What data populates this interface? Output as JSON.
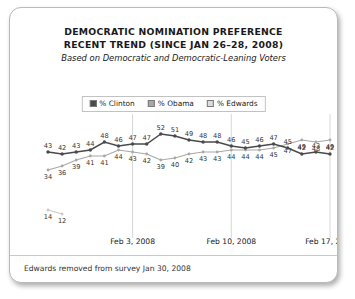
{
  "card": {
    "title_line1": "DEMOCRATIC NOMINATION PREFERENCE",
    "title_line2": "RECENT TREND (SINCE JAN 26–28, 2008)",
    "subtitle": "Based on Democratic and Democratic-Leaning Voters",
    "footnote": "Edwards removed from survey Jan 30, 2008"
  },
  "legend": {
    "items": [
      {
        "label": "% Clinton",
        "color": "#4a4a4a"
      },
      {
        "label": "% Obama",
        "color": "#a8a8a8"
      },
      {
        "label": "% Edwards",
        "color": "#dcdcdc"
      }
    ]
  },
  "chart_data": {
    "type": "line",
    "title": "DEMOCRATIC NOMINATION PREFERENCE RECENT TREND (SINCE JAN 26–28, 2008)",
    "subtitle": "Based on Democratic and Democratic-Leaning Voters",
    "xlabel": "",
    "ylabel": "",
    "ylim": [
      10,
      55
    ],
    "grid": "vertical-only",
    "legend_position": "top-center",
    "annotation": "Edwards removed from survey Jan 30, 2008",
    "n_points": 21,
    "tick_labels": [
      "Feb 3, 2008",
      "Feb 10, 2008",
      "Feb 17, 2008"
    ],
    "tick_indices": [
      6,
      13,
      20
    ],
    "series": [
      {
        "name": "% Clinton",
        "color": "#4a4a4a",
        "values": [
          43,
          42,
          43,
          44,
          48,
          46,
          47,
          47,
          52,
          51,
          49,
          48,
          48,
          46,
          45,
          46,
          47,
          45,
          42,
          43,
          42
        ]
      },
      {
        "name": "% Obama",
        "color": "#a8a8a8",
        "values": [
          34,
          36,
          39,
          41,
          41,
          44,
          43,
          42,
          39,
          40,
          42,
          43,
          43,
          44,
          44,
          44,
          45,
          47,
          49,
          48,
          49
        ]
      },
      {
        "name": "% Edwards",
        "color": "#c9c9c9",
        "values": [
          14,
          12,
          null,
          null,
          null,
          null,
          null,
          null,
          null,
          null,
          null,
          null,
          null,
          null,
          null,
          null,
          null,
          null,
          null,
          null,
          null
        ]
      }
    ]
  }
}
